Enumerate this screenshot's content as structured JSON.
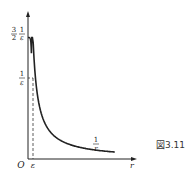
{
  "figure": {
    "caption": "図3.11",
    "axes": {
      "x_label": "r",
      "origin_label": "O",
      "x_tick_label": "ε"
    },
    "y_ticks": [
      {
        "coef": "3",
        "coef_den": "2",
        "num": "1",
        "den": "ε",
        "value": "3/(2ε)"
      },
      {
        "num": "1",
        "den": "ε",
        "value": "1/ε"
      }
    ],
    "curve_label": {
      "num": "1",
      "den": "r"
    },
    "ink_color": "#222222"
  }
}
